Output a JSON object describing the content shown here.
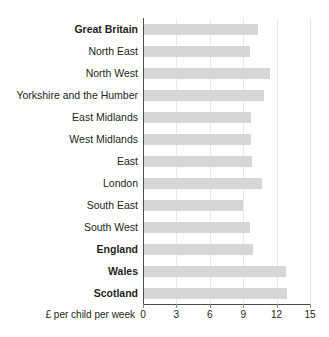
{
  "chart_data": {
    "type": "bar",
    "orientation": "horizontal",
    "title": "",
    "xlabel": "£ per child per week",
    "ylabel": "",
    "xlim": [
      0,
      15
    ],
    "xticks": [
      0,
      3,
      6,
      9,
      12,
      15
    ],
    "xtick_labels": [
      "0",
      "3",
      "6",
      "9",
      "12",
      "15"
    ],
    "grid": "vertical",
    "legend": "none",
    "bar_color": "#d6d6d6",
    "axis_color": "#4d4d4d",
    "gridline_color": "#e8e8e8",
    "categories": [
      "Great Britain",
      "North East",
      "North West",
      "Yorkshire and the Humber",
      "East Midlands",
      "West Midlands",
      "East",
      "London",
      "South East",
      "South West",
      "England",
      "Wales",
      "Scotland"
    ],
    "values": [
      10.3,
      9.6,
      11.4,
      10.9,
      9.7,
      9.7,
      9.8,
      10.7,
      9.0,
      9.6,
      9.9,
      12.8,
      12.9
    ],
    "bold_categories": [
      "Great Britain",
      "England",
      "Wales",
      "Scotland"
    ],
    "series": [
      {
        "name": "£ per child per week",
        "values": [
          10.3,
          9.6,
          11.4,
          10.9,
          9.7,
          9.7,
          9.8,
          10.7,
          9.0,
          9.6,
          9.9,
          12.8,
          12.9
        ]
      }
    ]
  }
}
